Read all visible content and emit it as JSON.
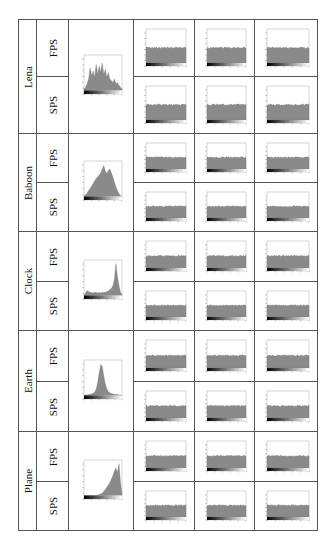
{
  "table": {
    "columns": [
      "image",
      "scheme",
      "original_histogram",
      "histogram_1",
      "histogram_2",
      "histogram_3"
    ],
    "groups": [
      {
        "image": "Lena",
        "rows": [
          "FPS",
          "SPS"
        ],
        "original_shape": "multi_peak"
      },
      {
        "image": "Baboon",
        "rows": [
          "FPS",
          "SPS"
        ],
        "original_shape": "mid_hump"
      },
      {
        "image": "Clock",
        "rows": [
          "FPS",
          "SPS"
        ],
        "original_shape": "right_spike"
      },
      {
        "image": "Earth",
        "rows": [
          "FPS",
          "SPS"
        ],
        "original_shape": "narrow_peak"
      },
      {
        "image": "Plane",
        "rows": [
          "FPS",
          "SPS"
        ],
        "original_shape": "right_rise"
      }
    ]
  },
  "chart_data": {
    "type": "table",
    "title": "",
    "row_labels": [
      "Lena FPS",
      "Lena SPS",
      "Baboon FPS",
      "Baboon SPS",
      "Clock FPS",
      "Clock SPS",
      "Earth FPS",
      "Earth SPS",
      "Plane FPS",
      "Plane SPS"
    ],
    "originals": {
      "Lena": [
        0.05,
        0.1,
        0.2,
        0.35,
        0.7,
        0.45,
        0.6,
        0.4,
        0.8,
        0.5,
        0.75,
        0.55,
        0.85,
        0.5,
        0.65,
        0.4,
        0.55,
        0.35,
        0.3,
        0.25,
        0.35,
        0.2,
        0.25,
        0.15,
        0.1,
        0.05
      ],
      "Baboon": [
        0.02,
        0.05,
        0.1,
        0.18,
        0.25,
        0.32,
        0.4,
        0.48,
        0.55,
        0.6,
        0.66,
        0.72,
        0.85,
        0.95,
        0.78,
        0.7,
        0.8,
        0.85,
        0.72,
        0.6,
        0.45,
        0.3,
        0.18,
        0.08,
        0.03,
        0.01
      ],
      "Clock": [
        0.02,
        0.08,
        0.15,
        0.12,
        0.1,
        0.09,
        0.08,
        0.1,
        0.09,
        0.08,
        0.09,
        0.08,
        0.1,
        0.09,
        0.1,
        0.12,
        0.14,
        0.18,
        0.22,
        0.3,
        0.5,
        0.98,
        0.6,
        0.3,
        0.1,
        0.03
      ],
      "Earth": [
        0.01,
        0.02,
        0.02,
        0.03,
        0.04,
        0.05,
        0.07,
        0.1,
        0.2,
        0.4,
        0.7,
        0.95,
        0.9,
        0.6,
        0.35,
        0.2,
        0.12,
        0.08,
        0.06,
        0.05,
        0.04,
        0.03,
        0.03,
        0.02,
        0.02,
        0.01
      ],
      "Plane": [
        0.0,
        0.0,
        0.0,
        0.0,
        0.0,
        0.0,
        0.0,
        0.0,
        0.01,
        0.02,
        0.03,
        0.05,
        0.08,
        0.12,
        0.18,
        0.25,
        0.32,
        0.4,
        0.5,
        0.62,
        0.75,
        0.85,
        0.7,
        0.98,
        0.4,
        0.05
      ]
    },
    "encrypted_level": 0.45
  }
}
